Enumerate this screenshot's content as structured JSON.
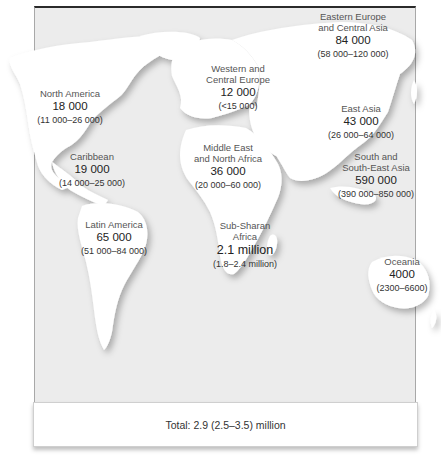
{
  "map": {
    "type": "world-choropleth-labels",
    "background_color": "#ececec",
    "landmass_color": "#ffffff",
    "regions": [
      {
        "name": "North America",
        "value": "18 000",
        "range": "(11 000–26 000)"
      },
      {
        "name": "Caribbean",
        "value": "19 000",
        "range": "(14 000–25 000)"
      },
      {
        "name": "Latin America",
        "value": "65 000",
        "range": "(51 000–84 000)"
      },
      {
        "name_line1": "Western and",
        "name_line2": "Central Europe",
        "value": "12 000",
        "range": "(<15 000)"
      },
      {
        "name_line1": "Middle East",
        "name_line2": "and North Africa",
        "value": "36 000",
        "range": "(20 000–60 000)"
      },
      {
        "name_line1": "Sub-Sharan",
        "name_line2": "Africa",
        "value": "2.1 million",
        "range": "(1.8–2.4 million)"
      },
      {
        "name_line1": "Eastern Europe",
        "name_line2": "and Central Asia",
        "value": "84 000",
        "range": "(58 000–120 000)"
      },
      {
        "name": "East Asia",
        "value": "43 000",
        "range": "(26 000–64 000)"
      },
      {
        "name_line1": "South and",
        "name_line2": "South-East Asia",
        "value": "590 000",
        "range": "(390 000–850 000)"
      },
      {
        "name": "Oceania",
        "value": "4000",
        "range": "(2300–6600)"
      }
    ],
    "total": "Total: 2.9 (2.5–3.5) million"
  }
}
